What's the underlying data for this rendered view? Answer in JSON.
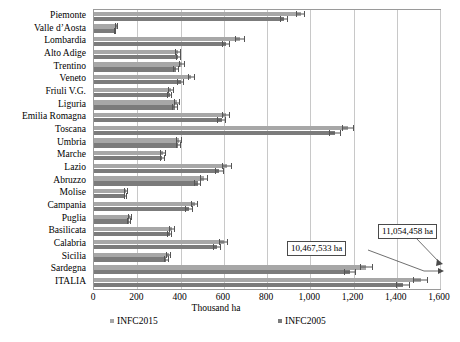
{
  "chart_data": {
    "type": "bar",
    "orientation": "horizontal",
    "title": "",
    "xlabel": "Thousand ha",
    "ylabel": "",
    "xlim": [
      0,
      1600
    ],
    "xticks": [
      "0",
      "200",
      "400",
      "600",
      "800",
      "1,000",
      "1,200",
      "1,400",
      "1,600"
    ],
    "xtick_values": [
      0,
      200,
      400,
      600,
      800,
      1000,
      1200,
      1400,
      1600
    ],
    "grid": true,
    "legend_position": "bottom",
    "categories": [
      "Piemonte",
      "Valle d’Aosta",
      "Lombardia",
      "Alto Adige",
      "Trentino",
      "Veneto",
      "Friuli V.G.",
      "Liguria",
      "Emilia Romagna",
      "Toscana",
      "Umbria",
      "Marche",
      "Lazio",
      "Abruzzo",
      "Molise",
      "Campania",
      "Puglia",
      "Basilicata",
      "Calabria",
      "Sicilia",
      "Sardegna",
      "ITALIA"
    ],
    "series": [
      {
        "name": "INFC2015",
        "color": "#a7a7a7",
        "values": [
          955,
          105,
          675,
          390,
          405,
          450,
          355,
          385,
          610,
          1175,
          395,
          320,
          615,
          510,
          150,
          465,
          165,
          360,
          600,
          345,
          1260,
          1510
        ],
        "errors": [
          20,
          7,
          22,
          14,
          14,
          16,
          14,
          14,
          20,
          28,
          14,
          13,
          22,
          18,
          9,
          18,
          10,
          14,
          20,
          13,
          30,
          34
        ]
      },
      {
        "name": "INFC2005",
        "color": "#7b7b7b",
        "values": [
          880,
          98,
          610,
          390,
          380,
          400,
          350,
          375,
          590,
          1115,
          390,
          315,
          580,
          480,
          145,
          440,
          160,
          350,
          570,
          335,
          1185,
          1430
        ],
        "errors": [
          18,
          6,
          20,
          13,
          13,
          15,
          13,
          13,
          19,
          26,
          13,
          12,
          20,
          17,
          8,
          17,
          9,
          13,
          19,
          12,
          28,
          32
        ]
      }
    ],
    "annotations": [
      {
        "id": "callout-2005",
        "text": "10,467,533 ha",
        "points_to": "ITALIA INFC2005"
      },
      {
        "id": "callout-2015",
        "text": "11,054,458 ha",
        "points_to": "ITALIA INFC2015"
      }
    ]
  }
}
